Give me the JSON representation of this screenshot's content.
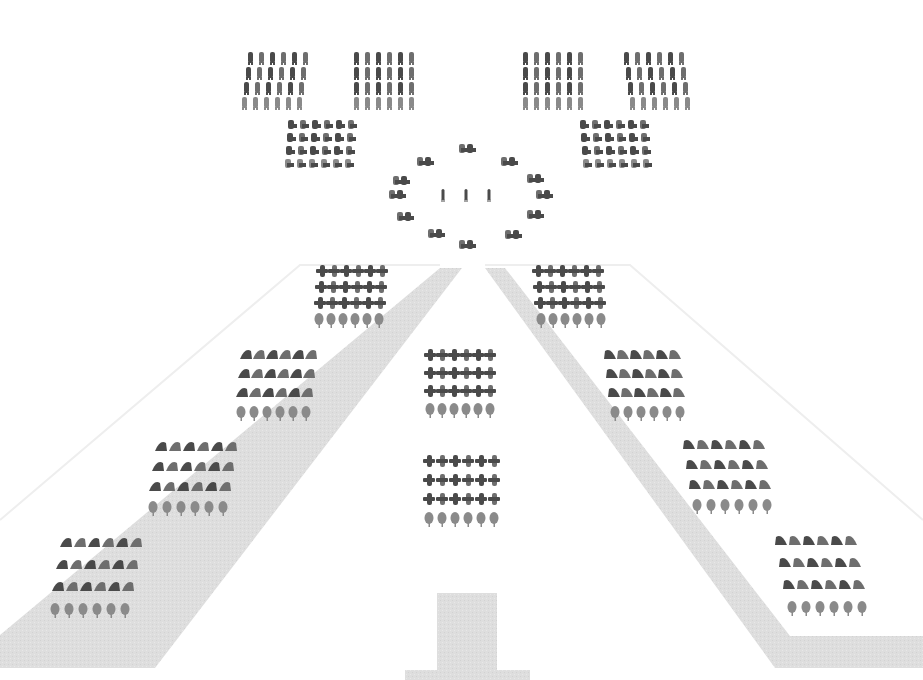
{
  "diagram": {
    "description": "Formation layout of figures arranged in blocks around a pyramid-shaped path",
    "colors": {
      "background": "#ffffff",
      "path": "#dcdcdc",
      "outline": "#eeeeee",
      "figure_dark": "#4a4a4a",
      "figure_mid": "#6e6e6e",
      "figure_light": "#8a8a8a"
    },
    "path": {
      "left_arm": [
        [
          0,
          635
        ],
        [
          440,
          268
        ],
        [
          462,
          268
        ],
        [
          155,
          668
        ],
        [
          0,
          668
        ]
      ],
      "right_arm": [
        [
          485,
          268
        ],
        [
          505,
          268
        ],
        [
          790,
          636
        ],
        [
          923,
          636
        ],
        [
          923,
          668
        ],
        [
          775,
          668
        ]
      ],
      "stem": {
        "x": 437,
        "y": 593,
        "w": 60,
        "h": 87
      },
      "stem_base": {
        "x": 405,
        "y": 670,
        "w": 125,
        "h": 10
      }
    },
    "outline": {
      "left": [
        [
          0,
          520
        ],
        [
          300,
          265
        ],
        [
          440,
          265
        ]
      ],
      "right": [
        [
          485,
          265
        ],
        [
          630,
          265
        ],
        [
          923,
          520
        ]
      ]
    },
    "blocks": [
      {
        "name": "top-row-block-1",
        "x": 246,
        "y": 52,
        "cols": 6,
        "rows": 4,
        "dx": 11,
        "dy": 15,
        "shear": -2,
        "type": "stand"
      },
      {
        "name": "top-row-block-2",
        "x": 352,
        "y": 52,
        "cols": 6,
        "rows": 4,
        "dx": 11,
        "dy": 15,
        "shear": 0,
        "type": "stand"
      },
      {
        "name": "top-row-block-3",
        "x": 521,
        "y": 52,
        "cols": 6,
        "rows": 4,
        "dx": 11,
        "dy": 15,
        "shear": 0,
        "type": "stand"
      },
      {
        "name": "top-row-block-4",
        "x": 622,
        "y": 52,
        "cols": 6,
        "rows": 4,
        "dx": 11,
        "dy": 15,
        "shear": 2,
        "type": "stand"
      },
      {
        "name": "second-row-block-left",
        "x": 287,
        "y": 120,
        "cols": 6,
        "rows": 4,
        "dx": 12,
        "dy": 13,
        "shear": -1,
        "type": "seat"
      },
      {
        "name": "second-row-block-right",
        "x": 579,
        "y": 120,
        "cols": 6,
        "rows": 4,
        "dx": 12,
        "dy": 13,
        "shear": 1,
        "type": "seat"
      },
      {
        "name": "upper-left-block",
        "x": 318,
        "y": 266,
        "cols": 6,
        "rows": 4,
        "dx": 12,
        "dy": 16,
        "shear": -1,
        "type": "cross"
      },
      {
        "name": "upper-right-block",
        "x": 534,
        "y": 266,
        "cols": 6,
        "rows": 4,
        "dx": 12,
        "dy": 16,
        "shear": 1,
        "type": "cross"
      },
      {
        "name": "center-upper-block",
        "x": 426,
        "y": 350,
        "cols": 6,
        "rows": 4,
        "dx": 12,
        "dy": 18,
        "shear": 0,
        "type": "cross"
      },
      {
        "name": "center-lower-block",
        "x": 425,
        "y": 456,
        "cols": 6,
        "rows": 4,
        "dx": 13,
        "dy": 19,
        "shear": 0,
        "type": "cross"
      },
      {
        "name": "left-block-2",
        "x": 243,
        "y": 350,
        "cols": 6,
        "rows": 4,
        "dx": 13,
        "dy": 19,
        "shear": -2,
        "type": "lean-left"
      },
      {
        "name": "left-block-3",
        "x": 158,
        "y": 442,
        "cols": 6,
        "rows": 4,
        "dx": 14,
        "dy": 20,
        "shear": -3,
        "type": "lean-left"
      },
      {
        "name": "left-block-4",
        "x": 63,
        "y": 538,
        "cols": 6,
        "rows": 4,
        "dx": 14,
        "dy": 22,
        "shear": -4,
        "type": "lean-left"
      },
      {
        "name": "right-block-2",
        "x": 605,
        "y": 350,
        "cols": 6,
        "rows": 4,
        "dx": 13,
        "dy": 19,
        "shear": 2,
        "type": "lean-right"
      },
      {
        "name": "right-block-3",
        "x": 684,
        "y": 440,
        "cols": 6,
        "rows": 4,
        "dx": 14,
        "dy": 20,
        "shear": 3,
        "type": "lean-right"
      },
      {
        "name": "right-block-4",
        "x": 776,
        "y": 536,
        "cols": 6,
        "rows": 4,
        "dx": 14,
        "dy": 22,
        "shear": 4,
        "type": "lean-right"
      }
    ],
    "ring": {
      "center": [
        466,
        196
      ],
      "pairs": [
        [
          466,
          150
        ],
        [
          424,
          163
        ],
        [
          508,
          163
        ],
        [
          400,
          182
        ],
        [
          534,
          180
        ],
        [
          396,
          196
        ],
        [
          543,
          196
        ],
        [
          404,
          218
        ],
        [
          534,
          216
        ],
        [
          435,
          235
        ],
        [
          512,
          236
        ],
        [
          466,
          246
        ]
      ],
      "inner_singles": [
        [
          443,
          196
        ],
        [
          466,
          196
        ],
        [
          489,
          196
        ]
      ]
    }
  }
}
